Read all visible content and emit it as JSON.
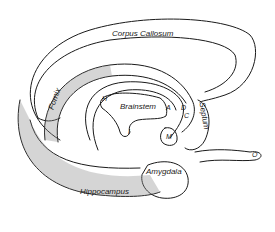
{
  "diagram": {
    "colors": {
      "ink": "#1a1a1a",
      "background": "#ffffff",
      "shade": "#8a8a8a"
    },
    "labels": {
      "corpus_callosum": "Corpus Callosum",
      "fornix": "Fornix",
      "brainstem": "Brainstem",
      "h": "H",
      "a": "A",
      "i": "I",
      "m": "M",
      "septum": "Septum",
      "d": "D",
      "c": "C",
      "o": "O",
      "amygdala": "Amygdala",
      "hippocampus": "Hippocampus"
    }
  }
}
